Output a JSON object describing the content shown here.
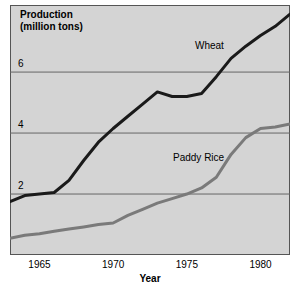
{
  "chart_data": {
    "type": "line",
    "xlabel": "Year",
    "ylabel": "Production (million tons)",
    "xlim": [
      1963,
      1982
    ],
    "ylim": [
      0,
      8.2
    ],
    "xticks": [
      1965,
      1970,
      1975,
      1980
    ],
    "yticks": [
      2,
      4,
      6
    ],
    "grid": true,
    "legend_position": "inline-annotations",
    "background_color": "#d4d4d4",
    "series": [
      {
        "name": "Wheat",
        "color": "#1a1a1a",
        "x": [
          1963,
          1964,
          1965,
          1966,
          1967,
          1968,
          1969,
          1970,
          1971,
          1972,
          1973,
          1974,
          1975,
          1976,
          1977,
          1978,
          1979,
          1980,
          1981,
          1982
        ],
        "values": [
          1.75,
          1.95,
          2.0,
          2.05,
          2.45,
          3.1,
          3.7,
          4.15,
          4.55,
          4.95,
          5.35,
          5.2,
          5.2,
          5.3,
          5.85,
          6.45,
          6.85,
          7.2,
          7.5,
          7.9
        ]
      },
      {
        "name": "Paddy Rice",
        "color": "#7a7a7a",
        "x": [
          1963,
          1964,
          1965,
          1966,
          1967,
          1968,
          1969,
          1970,
          1971,
          1972,
          1973,
          1974,
          1975,
          1976,
          1977,
          1978,
          1979,
          1980,
          1981,
          1982
        ],
        "values": [
          0.55,
          0.65,
          0.7,
          0.78,
          0.85,
          0.92,
          1.0,
          1.05,
          1.3,
          1.5,
          1.7,
          1.85,
          2.0,
          2.2,
          2.55,
          3.3,
          3.85,
          4.15,
          4.2,
          4.3
        ]
      }
    ]
  },
  "labels": {
    "title": "Production",
    "title_line2": "(million tons)",
    "xlabel": "Year",
    "wheat": "Wheat",
    "paddy_rice": "Paddy Rice",
    "ytick_2": "2",
    "ytick_4": "4",
    "ytick_6": "6",
    "xtick_1965": "1965",
    "xtick_1970": "1970",
    "xtick_1975": "1975",
    "xtick_1980": "1980"
  }
}
